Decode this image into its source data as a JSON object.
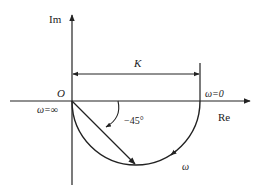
{
  "diagram": {
    "type": "nyquist-plot",
    "axes": {
      "imag_label": "Im",
      "real_label": "Re",
      "origin_label": "O"
    },
    "labels": {
      "gain": "K",
      "omega_zero": "ω=0",
      "omega_inf": "ω=∞",
      "angle": "−45°",
      "omega": "ω"
    },
    "colors": {
      "stroke": "#222222",
      "background": "#ffffff"
    }
  }
}
